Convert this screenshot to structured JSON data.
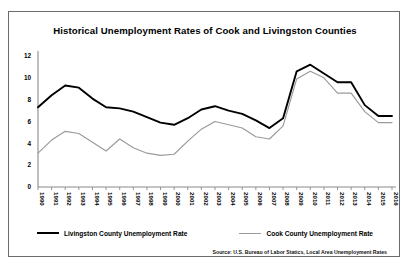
{
  "chart_data": {
    "type": "line",
    "title": "Historical Unemployment Rates of Cook and Livingston Counties",
    "xlabel": "",
    "ylabel": "",
    "ylim": [
      0,
      12
    ],
    "yticks": [
      0,
      2,
      4,
      6,
      8,
      10,
      12
    ],
    "grid": false,
    "legend_position": "bottom",
    "source": "Source: U.S. Bureau of Labor Statics, Local Area Unemployment Rates",
    "categories": [
      "1990",
      "1991",
      "1992",
      "1993",
      "1994",
      "1995",
      "1996",
      "1997",
      "1998",
      "1999",
      "2000",
      "2001",
      "2002",
      "2003",
      "2004",
      "2005",
      "2006",
      "2007",
      "2008",
      "2009",
      "2010",
      "2011",
      "2012",
      "2013",
      "2014",
      "2015",
      "2016"
    ],
    "series": [
      {
        "name": "Livingston County Unemployment Rate",
        "color": "#000000",
        "values": [
          7.3,
          8.4,
          9.3,
          9.1,
          8.1,
          7.3,
          7.2,
          6.9,
          6.4,
          5.9,
          5.7,
          6.3,
          7.1,
          7.4,
          7.0,
          6.7,
          6.1,
          5.4,
          6.3,
          10.6,
          11.2,
          10.4,
          9.6,
          9.6,
          7.5,
          6.5,
          6.5
        ],
        "min": 5.4,
        "max": 11.2,
        "min_year": "2007",
        "max_year": "2010"
      },
      {
        "name": "Cook County Unemployment Rate",
        "color": "#9a9a9a",
        "values": [
          3.1,
          4.3,
          5.1,
          4.9,
          4.1,
          3.3,
          4.4,
          3.6,
          3.1,
          2.9,
          3.0,
          4.2,
          5.3,
          6.0,
          5.7,
          5.4,
          4.6,
          4.4,
          5.6,
          9.9,
          10.6,
          10.0,
          8.6,
          8.6,
          6.9,
          5.9,
          5.9
        ],
        "min": 2.9,
        "max": 10.6,
        "min_year": "1999",
        "max_year": "2010"
      }
    ]
  },
  "legend": {
    "items": [
      {
        "label": "Livingston County Unemployment Rate",
        "style": "black"
      },
      {
        "label": "Cook County Unemployment Rate",
        "style": "gray"
      }
    ]
  }
}
